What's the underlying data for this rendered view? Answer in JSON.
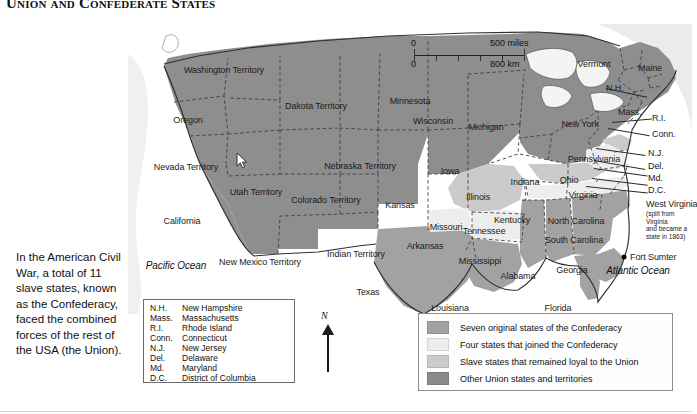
{
  "title": "Union and Confederate States",
  "caption": "In the American Civil War, a total of 11 slave states, known as the Confederacy, faced the combined forces of the rest of the USA (the Union).",
  "scale": {
    "miles_start": "0",
    "miles_end": "500 miles",
    "km_start": "0",
    "km_end": "800 km"
  },
  "compass": {
    "north_label": "N"
  },
  "colors": {
    "seven_original": "#9a9a9a",
    "four_joined": "#e3e3e3",
    "slave_loyal": "#c4c4c4",
    "other_union": "#8f8f8f",
    "ocean": "#f2f2f2",
    "border": "#3a3a3a"
  },
  "key": {
    "items": [
      {
        "label": "Seven original states of the Confederacy",
        "swatch": "#a2a2a2"
      },
      {
        "label": "Four states that joined the Confederacy",
        "swatch": "#ededed"
      },
      {
        "label": "Slave states that remained loyal to the Union",
        "swatch": "#cbcbcb"
      },
      {
        "label": "Other Union states and territories",
        "swatch": "#8b8b8b"
      }
    ]
  },
  "abbreviations": [
    {
      "abbr": "N.H.",
      "full": "New Hampshire"
    },
    {
      "abbr": "Mass.",
      "full": "Massachusetts"
    },
    {
      "abbr": "R.I.",
      "full": "Rhode Island"
    },
    {
      "abbr": "Conn.",
      "full": "Connecticut"
    },
    {
      "abbr": "N.J.",
      "full": "New Jersey"
    },
    {
      "abbr": "Del.",
      "full": "Delaware"
    },
    {
      "abbr": "Md.",
      "full": "Maryland"
    },
    {
      "abbr": "D.C.",
      "full": "District of Columbia"
    }
  ],
  "map_labels": {
    "oceans": [
      {
        "name": "Pacific Ocean",
        "text": "Pacific Ocean"
      },
      {
        "name": "Atlantic Ocean",
        "text": "Atlantic Ocean"
      }
    ],
    "territories": [
      {
        "text": "Washington\nTerritory"
      },
      {
        "text": "Oregon"
      },
      {
        "text": "Dakota Territory"
      },
      {
        "text": "Minnesota"
      },
      {
        "text": "Wisconsin"
      },
      {
        "text": "Michigan"
      },
      {
        "text": "Vermont"
      },
      {
        "text": "Maine"
      },
      {
        "text": "New York"
      },
      {
        "text": "Nevada\nTerritory"
      },
      {
        "text": "Utah\nTerritory"
      },
      {
        "text": "Nebraska Territory"
      },
      {
        "text": "Iowa"
      },
      {
        "text": "Illinois"
      },
      {
        "text": "Indiana"
      },
      {
        "text": "Ohio"
      },
      {
        "text": "Pennsylvania"
      },
      {
        "text": "California"
      },
      {
        "text": "Colorado\nTerritory"
      },
      {
        "text": "Kansas"
      },
      {
        "text": "Missouri"
      },
      {
        "text": "Kentucky"
      },
      {
        "text": "Virginia"
      },
      {
        "text": "New Mexico\nTerritory"
      },
      {
        "text": "Indian\nTerritory"
      },
      {
        "text": "Arkansas"
      },
      {
        "text": "Tennessee"
      },
      {
        "text": "North Carolina"
      },
      {
        "text": "South Carolina"
      },
      {
        "text": "Texas"
      },
      {
        "text": "Mississippi"
      },
      {
        "text": "Alabama"
      },
      {
        "text": "Georgia"
      },
      {
        "text": "Louisiana"
      },
      {
        "text": "Florida"
      }
    ],
    "callouts": [
      {
        "text": "N.H."
      },
      {
        "text": "Mass."
      },
      {
        "text": "R.I."
      },
      {
        "text": "Conn."
      },
      {
        "text": "N.J."
      },
      {
        "text": "Del."
      },
      {
        "text": "Md."
      },
      {
        "text": "D.C."
      }
    ],
    "west_virginia": {
      "title": "West Virginia",
      "note": "(split from Virginia\nand became a\nstate in 1863)"
    },
    "fort_sumter": "Fort Sumter"
  },
  "state_labels": {
    "washington_territory": "Washington\nTerritory",
    "oregon": "Oregon",
    "dakota_territory": "Dakota Territory",
    "minnesota": "Minnesota",
    "wisconsin": "Wisconsin",
    "michigan": "Michigan",
    "vermont": "Vermont",
    "maine": "Maine",
    "new_york": "New York",
    "nevada_territory": "Nevada\nTerritory",
    "utah_territory": "Utah\nTerritory",
    "nebraska_territory": "Nebraska Territory",
    "iowa": "Iowa",
    "illinois": "Illinois",
    "indiana": "Indiana",
    "ohio": "Ohio",
    "pennsylvania": "Pennsylvania",
    "california": "California",
    "colorado_territory": "Colorado\nTerritory",
    "kansas": "Kansas",
    "missouri": "Missouri",
    "kentucky": "Kentucky",
    "virginia": "Virginia",
    "new_mexico_territory": "New Mexico\nTerritory",
    "indian_territory": "Indian\nTerritory",
    "arkansas": "Arkansas",
    "tennessee": "Tennessee",
    "north_carolina": "North Carolina",
    "south_carolina": "South Carolina",
    "texas": "Texas",
    "mississippi": "Mississippi",
    "alabama": "Alabama",
    "georgia": "Georgia",
    "louisiana": "Louisiana",
    "florida": "Florida",
    "pacific_ocean": "Pacific Ocean",
    "atlantic_ocean": "Atlantic Ocean",
    "nh": "N.H.",
    "mass": "Mass.",
    "ri": "R.I.",
    "conn": "Conn.",
    "nj": "N.J.",
    "del": "Del.",
    "md": "Md.",
    "dc": "D.C.",
    "west_virginia": "West Virginia",
    "west_virginia_note": "(split from Virginia\nand became a\nstate in 1863)",
    "fort_sumter": "Fort Sumter"
  }
}
